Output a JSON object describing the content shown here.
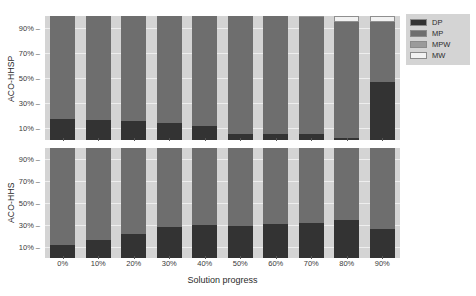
{
  "chart_data": {
    "type": "bar",
    "subtype": "stacked-percentage",
    "title": "",
    "xlabel": "Solution progress",
    "ylabel": "",
    "grid": true,
    "legend_position": "right",
    "categories": [
      "0%",
      "10%",
      "20%",
      "30%",
      "40%",
      "50%",
      "60%",
      "70%",
      "80%",
      "90%"
    ],
    "ytick_labels": [
      "90%",
      "70%",
      "50%",
      "30%",
      "10%"
    ],
    "ytick_values": [
      90,
      70,
      50,
      30,
      10
    ],
    "ylim": [
      0,
      100
    ],
    "series_names": [
      "DP",
      "MP",
      "MPW",
      "MW"
    ],
    "colors": {
      "DP": "#333333",
      "MP": "#6e6e6e",
      "MPW": "#9a9a9a",
      "MW": "#f2f2f2",
      "panel_background": "#d4d4d4",
      "gridline": "#eeeeee",
      "figure_background": "#ffffff"
    },
    "panels": [
      {
        "name": "ACO-HHSP",
        "label": "ACO-HHSP",
        "series": [
          {
            "name": "DP",
            "values": [
              17,
              16,
              15,
              14,
              11,
              5,
              5,
              5,
              2,
              47
            ]
          },
          {
            "name": "MP",
            "values": [
              83,
              84,
              85,
              86,
              89,
              95,
              95,
              94,
              93,
              48
            ]
          },
          {
            "name": "MPW",
            "values": [
              0,
              0,
              0,
              0,
              0,
              0,
              0,
              0,
              0,
              0
            ]
          },
          {
            "name": "MW",
            "values": [
              0,
              0,
              0,
              0,
              0,
              0,
              0,
              1,
              5,
              5
            ]
          }
        ]
      },
      {
        "name": "ACO-HHS",
        "label": "ACO-HHS",
        "series": [
          {
            "name": "DP",
            "values": [
              12,
              16,
              22,
              28,
              30,
              29,
              31,
              32,
              35,
              26
            ]
          },
          {
            "name": "MP",
            "values": [
              88,
              84,
              78,
              72,
              70,
              71,
              69,
              68,
              65,
              74
            ]
          },
          {
            "name": "MPW",
            "values": [
              0,
              0,
              0,
              0,
              0,
              0,
              0,
              0,
              0,
              0
            ]
          },
          {
            "name": "MW",
            "values": [
              0,
              0,
              0,
              0,
              0,
              0,
              0,
              0,
              0,
              0
            ]
          }
        ]
      }
    ],
    "legend": [
      {
        "label": "DP",
        "color": "#333333"
      },
      {
        "label": "MP",
        "color": "#6e6e6e"
      },
      {
        "label": "MPW",
        "color": "#9a9a9a"
      },
      {
        "label": "MW",
        "color": "#f2f2f2"
      }
    ]
  }
}
